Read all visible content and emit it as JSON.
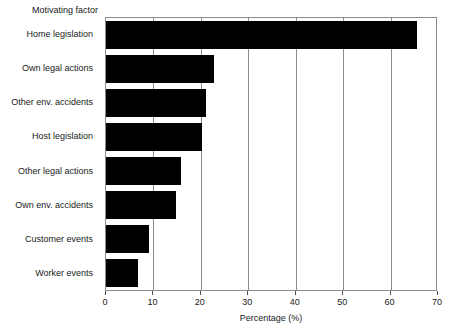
{
  "chart_data": {
    "type": "bar",
    "orientation": "horizontal",
    "title": "",
    "xlabel": "Percentage (%)",
    "ylabel": "Motivating factor",
    "xlim": [
      0,
      70
    ],
    "xticks": [
      0,
      10,
      20,
      30,
      40,
      50,
      60,
      70
    ],
    "xtick_labels": [
      "0",
      "10",
      "20",
      "30",
      "40",
      "50",
      "60",
      "70"
    ],
    "grid": true,
    "grid_axis": "x",
    "legend": false,
    "bar_color": "#000000",
    "categories": [
      "Home legislation",
      "Own legal actions",
      "Other env. accidents",
      "Host legislation",
      "Other legal actions",
      "Own env. accidents",
      "Customer events",
      "Worker events"
    ],
    "values": [
      65.5,
      22.8,
      21.0,
      20.2,
      15.8,
      14.7,
      9.0,
      6.7
    ]
  },
  "colors": {
    "bar": "#000000",
    "frame": "#8c8c8c",
    "grid": "#8c8c8c",
    "text": "#1a1a1a",
    "background": "#ffffff"
  }
}
